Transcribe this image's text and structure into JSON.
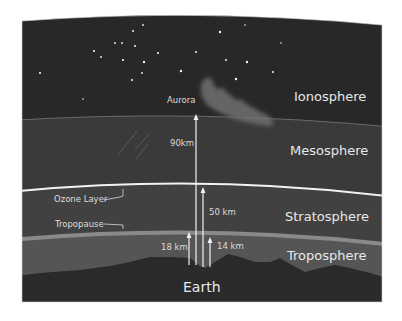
{
  "colors": {
    "background": "#ffffff",
    "ionosphere": "#282828",
    "mesosphere": "#3a3a3a",
    "stratosphere": "#414141",
    "troposphere": "#555555",
    "earth": "#2a2a2a",
    "ozone_line": "#f2f2f2",
    "tropopause_band": "#8a8a8a",
    "text": "#e8e8e8",
    "aurora": "#6e6e6e"
  },
  "layers": {
    "ionosphere": "Ionosphere",
    "mesosphere": "Mesosphere",
    "stratosphere": "Stratosphere",
    "troposphere": "Troposphere",
    "earth": "Earth"
  },
  "annotations": {
    "aurora": "Aurora",
    "ozone_layer": "Ozone Layer",
    "tropopause": "Tropopause"
  },
  "altitudes": {
    "mesosphere_top": "90km",
    "stratosphere_top": "50 km",
    "troposphere_top_equator": "18 km",
    "troposphere_top_poles": "14 km"
  }
}
